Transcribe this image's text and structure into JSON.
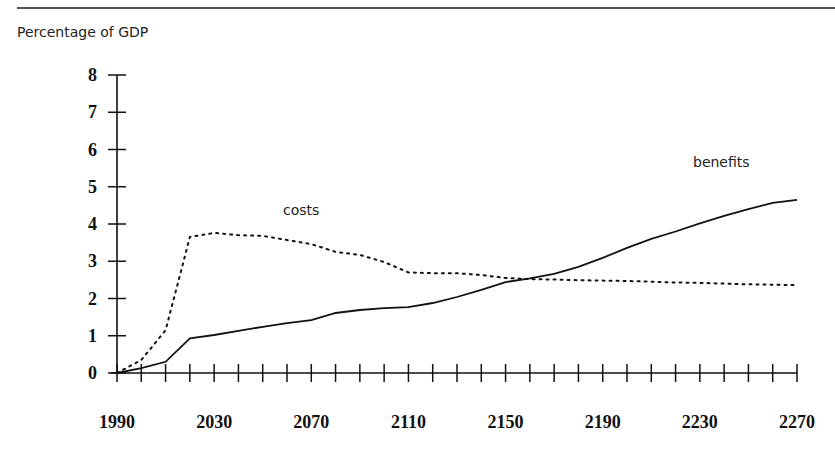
{
  "header": {
    "ylabel": "Percentage of GDP"
  },
  "annotations": {
    "costs": "costs",
    "benefits": "benefits"
  },
  "chart_data": {
    "type": "line",
    "title": "",
    "xlabel": "",
    "ylabel": "Percentage of GDP",
    "ylim": [
      0,
      8
    ],
    "xlim": [
      1990,
      2270
    ],
    "grid": false,
    "legend": "inline labels",
    "yticks": [
      0,
      1,
      2,
      3,
      4,
      5,
      6,
      7,
      8
    ],
    "xtick_labels": [
      "1990",
      "2030",
      "2070",
      "2110",
      "2150",
      "2190",
      "2230",
      "2270"
    ],
    "x": [
      1990,
      2000,
      2010,
      2020,
      2030,
      2040,
      2050,
      2060,
      2070,
      2080,
      2090,
      2100,
      2110,
      2120,
      2130,
      2140,
      2150,
      2160,
      2170,
      2180,
      2190,
      2200,
      2210,
      2220,
      2230,
      2240,
      2250,
      2260,
      2270
    ],
    "series": [
      {
        "name": "costs",
        "style": "dotted",
        "values": [
          0.0,
          0.35,
          1.15,
          3.65,
          3.76,
          3.7,
          3.68,
          3.57,
          3.46,
          3.25,
          3.17,
          2.98,
          2.7,
          2.68,
          2.68,
          2.63,
          2.55,
          2.52,
          2.51,
          2.49,
          2.48,
          2.47,
          2.45,
          2.43,
          2.42,
          2.4,
          2.38,
          2.37,
          2.36
        ]
      },
      {
        "name": "benefits",
        "style": "solid",
        "values": [
          0.0,
          0.13,
          0.3,
          0.93,
          1.02,
          1.13,
          1.24,
          1.34,
          1.42,
          1.61,
          1.69,
          1.74,
          1.77,
          1.88,
          2.04,
          2.23,
          2.44,
          2.54,
          2.66,
          2.85,
          3.09,
          3.36,
          3.6,
          3.8,
          4.02,
          4.22,
          4.4,
          4.57,
          4.65
        ]
      }
    ]
  },
  "colors": {
    "ink": "#111111",
    "rule": "#555555"
  }
}
